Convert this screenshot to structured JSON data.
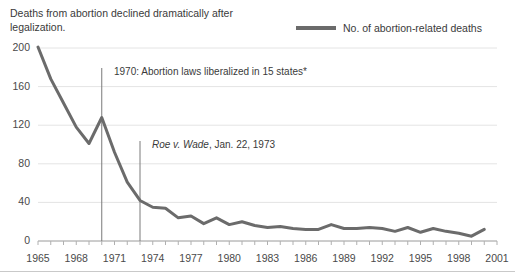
{
  "title": "Deaths from abortion declined dramatically after legalization.",
  "legend": {
    "label": "No. of abortion-related deaths",
    "color": "#6b6b6b",
    "position": "top-right"
  },
  "annotations": [
    {
      "text": "1970: Abortion laws liberalized in 15 states*",
      "year": 1970
    },
    {
      "text_italic": "Roe v. Wade",
      "text_rest": ", Jan. 22, 1973",
      "year": 1973
    }
  ],
  "axis": {
    "y_ticks": [
      "0",
      "40",
      "80",
      "120",
      "160",
      "200"
    ],
    "x_ticks": [
      "1965",
      "1968",
      "1971",
      "1974",
      "1977",
      "1980",
      "1983",
      "1986",
      "1989",
      "1992",
      "1995",
      "1998",
      "2001"
    ]
  },
  "chart_data": {
    "type": "line",
    "title": "Deaths from abortion declined dramatically after legalization.",
    "xlabel": "",
    "ylabel": "",
    "xlim": [
      1965,
      2001
    ],
    "ylim": [
      0,
      200
    ],
    "grid": true,
    "legend_position": "top-right",
    "series": [
      {
        "name": "No. of abortion-related deaths",
        "color": "#6b6b6b",
        "x": [
          1965,
          1966,
          1967,
          1968,
          1969,
          1970,
          1971,
          1972,
          1973,
          1974,
          1975,
          1976,
          1977,
          1978,
          1979,
          1980,
          1981,
          1982,
          1983,
          1984,
          1985,
          1986,
          1987,
          1988,
          1989,
          1990,
          1991,
          1992,
          1993,
          1994,
          1995,
          1996,
          1997,
          1998,
          1999,
          2000
        ],
        "values": [
          201,
          168,
          143,
          118,
          101,
          128,
          92,
          61,
          42,
          35,
          34,
          24,
          26,
          18,
          24,
          17,
          20,
          16,
          14,
          15,
          13,
          12,
          12,
          17,
          13,
          13,
          14,
          13,
          10,
          14,
          9,
          13,
          10,
          8,
          5,
          12
        ]
      }
    ],
    "event_markers": [
      {
        "year": 1970,
        "label": "1970: Abortion laws liberalized in 15 states*"
      },
      {
        "year": 1973,
        "label": "Roe v. Wade, Jan. 22, 1973"
      }
    ]
  }
}
